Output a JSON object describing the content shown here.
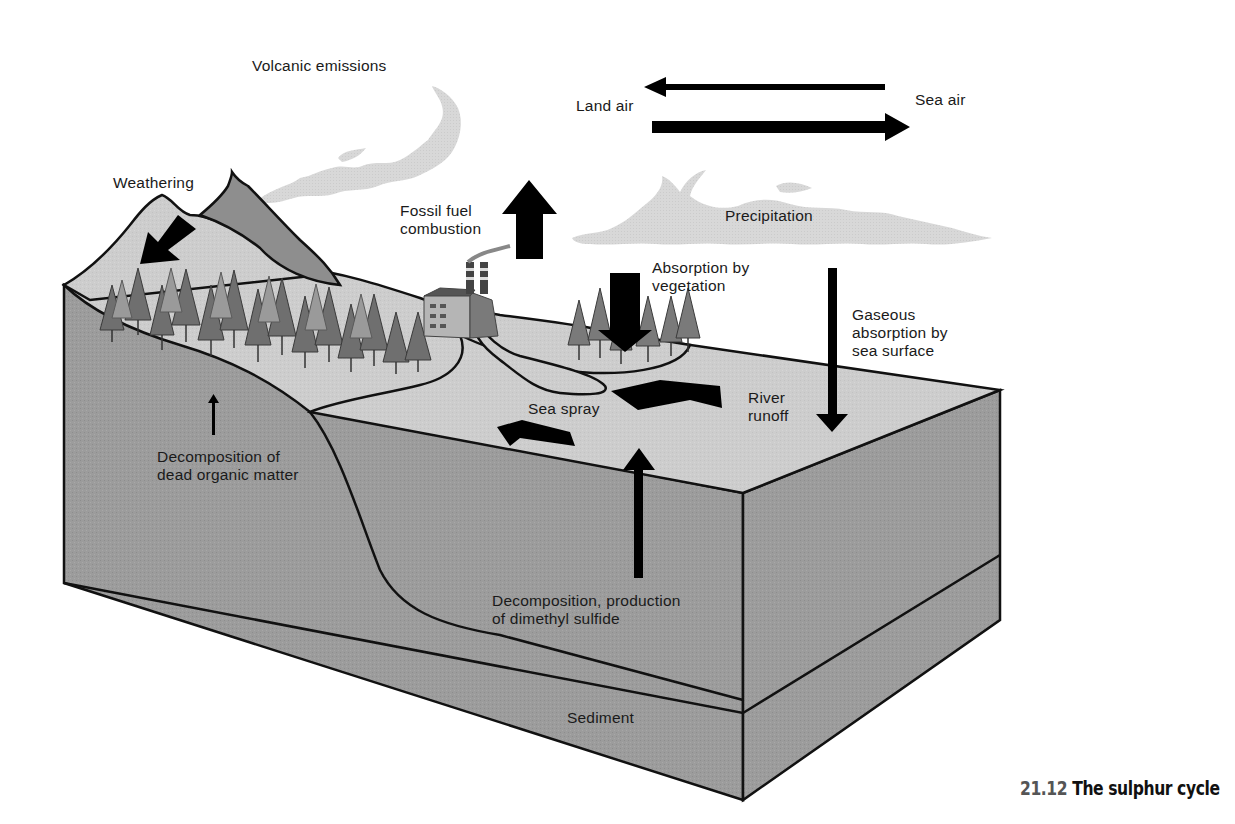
{
  "figure": {
    "number": "21.12",
    "title": "The sulphur cycle"
  },
  "labels": {
    "volcanic_emissions": "Volcanic emissions",
    "land_air": "Land air",
    "sea_air": "Sea air",
    "weathering": "Weathering",
    "fossil_fuel": "Fossil fuel\ncombustion",
    "precipitation": "Precipitation",
    "absorption_vegetation": "Absorption by\nvegetation",
    "gaseous_absorption": "Gaseous\nabsorption by\nsea surface",
    "sea_spray": "Sea spray",
    "river_runoff": "River\nrunoff",
    "decomposition_dead": "Decomposition of\ndead organic matter",
    "decomposition_dms": "Decomposition, production\nof dimethyl sulfide",
    "sediment": "Sediment"
  },
  "colors": {
    "cloud": "#d9d9d9",
    "sea_surface": "#cfcfcf",
    "land_surface": "#c8c8c8",
    "block_side": "#9a9a9a",
    "block_right": "#8e8e8e",
    "outline": "#111111",
    "arrow": "#000000"
  }
}
